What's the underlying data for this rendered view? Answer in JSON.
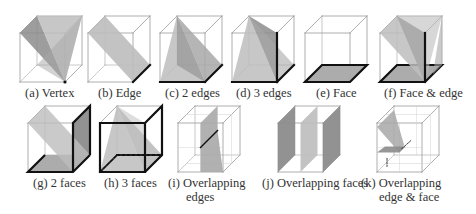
{
  "figure": {
    "panels": [
      {
        "id": "a",
        "label": "(a) Vertex",
        "lines": [
          "(a) Vertex"
        ],
        "config": "vertex"
      },
      {
        "id": "b",
        "label": "(b) Edge",
        "lines": [
          "(b) Edge"
        ],
        "config": "edge"
      },
      {
        "id": "c",
        "label": "(c) 2 edges",
        "lines": [
          "(c) 2 edges"
        ],
        "config": "two-edges"
      },
      {
        "id": "d",
        "label": "(d) 3 edges",
        "lines": [
          "(d) 3 edges"
        ],
        "config": "three-edges"
      },
      {
        "id": "e",
        "label": "(e) Face",
        "lines": [
          "(e) Face"
        ],
        "config": "face"
      },
      {
        "id": "f",
        "label": "(f) Face & edge",
        "lines": [
          "(f) Face & edge"
        ],
        "config": "face-edge"
      },
      {
        "id": "g",
        "label": "(g) 2 faces",
        "lines": [
          "(g) 2 faces"
        ],
        "config": "two-faces"
      },
      {
        "id": "h",
        "label": "(h) 3 faces",
        "lines": [
          "(h) 3 faces"
        ],
        "config": "three-faces"
      },
      {
        "id": "i",
        "label": "(i) Overlapping edges",
        "lines": [
          "(i) Overlapping",
          "edges"
        ],
        "config": "overlapping-edges"
      },
      {
        "id": "j",
        "label": "(j) Overlapping faces",
        "lines": [
          "(j) Overlapping faces"
        ],
        "config": "overlapping-faces"
      },
      {
        "id": "k",
        "label": "(k) Overlapping edge & face",
        "lines": [
          "(k) Overlapping",
          "edge & face"
        ],
        "config": "overlapping-edge-face"
      }
    ],
    "colors": {
      "cube_edge": "#9a9a9a",
      "hidden_edge": "#b0b0b0",
      "plane_light": "#bdbdbd",
      "plane_mid": "#a8a8a8",
      "plane_dark": "#8c8c8c",
      "highlight": "#111111"
    }
  }
}
